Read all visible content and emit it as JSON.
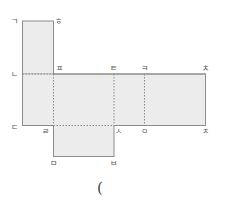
{
  "diagram": {
    "type": "cube-net",
    "colors": {
      "fill": "#ececec",
      "stroke": "#8c8c8c",
      "dotted": "#8c8c8c",
      "label": "#555555"
    },
    "labels": {
      "top_left": "ㄱ",
      "top_right_of_top_square": "ㅎ",
      "left_middle": "ㄴ",
      "fold_top_1": "ㅍ",
      "fold_top_2": "ㅌ",
      "fold_top_3": "ㅋ",
      "right_top": "ㅊ",
      "left_bottom": "ㄷ",
      "fold_bottom_1": "ㄹ",
      "fold_bottom_2": "ㅅ",
      "fold_bottom_3": "ㅇ",
      "right_bottom": "ㅈ",
      "bottom_left": "ㅁ",
      "bottom_right": "ㅂ"
    },
    "answer_blank": "("
  }
}
